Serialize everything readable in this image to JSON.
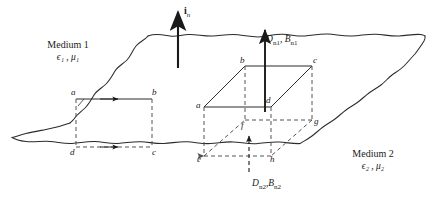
{
  "figure": {
    "stroke_color": "#2b2b2b",
    "surface_color": "#3a3a3a",
    "dash_color": "#555555"
  },
  "media": {
    "upper": {
      "name": "Medium 1",
      "epsilon": "ϵ",
      "epsilon_sub": "1",
      "mu": "μ",
      "mu_sub": "1",
      "params": "ϵ₁ , μ₁"
    },
    "lower": {
      "name": "Medium 2",
      "epsilon": "ϵ",
      "epsilon_sub": "2",
      "mu": "μ",
      "mu_sub": "2",
      "params": "ϵ₂ , μ₂"
    }
  },
  "normal_vector": {
    "symbol": "i",
    "subscript": "n",
    "label": "i",
    "direction": "up"
  },
  "fields": {
    "upper": {
      "label": "D",
      "sub1": "n1",
      "label2": "B",
      "sub2": "n1",
      "text": "D n1 , B n1"
    },
    "lower": {
      "label": "D",
      "sub1": "n2",
      "label2": "B",
      "sub2": "n2",
      "text": "D n2 , B n2"
    }
  },
  "contour_rectangle": {
    "name": "amperian-loop",
    "vertices": [
      {
        "id": "a",
        "label": "a",
        "position": "top-left"
      },
      {
        "id": "b",
        "label": "b",
        "position": "top-right"
      },
      {
        "id": "c",
        "label": "c",
        "position": "bottom-right"
      },
      {
        "id": "d",
        "label": "d",
        "position": "bottom-left"
      }
    ],
    "arrows": [
      "top-edge-right",
      "bottom-edge-right"
    ]
  },
  "pillbox_cube": {
    "name": "gaussian-pillbox",
    "vertices": [
      {
        "id": "a",
        "label": "a"
      },
      {
        "id": "b",
        "label": "b"
      },
      {
        "id": "c",
        "label": "c"
      },
      {
        "id": "d",
        "label": "d"
      },
      {
        "id": "e",
        "label": "e"
      },
      {
        "id": "f",
        "label": "f"
      },
      {
        "id": "g",
        "label": "g"
      },
      {
        "id": "h",
        "label": "h"
      }
    ]
  }
}
